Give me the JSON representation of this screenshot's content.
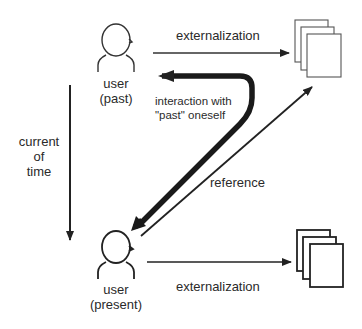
{
  "diagram": {
    "nodes": {
      "user_past": {
        "line1": "user",
        "line2": "(past)"
      },
      "user_present": {
        "line1": "user",
        "line2": "(present)"
      },
      "documents_past": {
        "label": ""
      },
      "documents_present": {
        "label": ""
      }
    },
    "edges": {
      "externalization_past": {
        "label": "externalization"
      },
      "externalization_present": {
        "label": "externalization"
      },
      "interaction": {
        "line1": "interaction with",
        "line2": "\"past\" oneself"
      },
      "reference": {
        "label": "reference"
      },
      "time": {
        "line1": "current",
        "line2": "of",
        "line3": "time"
      }
    },
    "colors": {
      "stroke": "#222222",
      "background": "#ffffff"
    }
  }
}
